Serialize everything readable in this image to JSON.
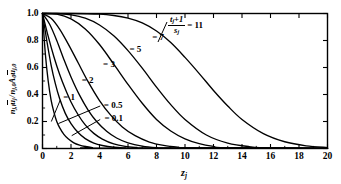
{
  "chart_data": {
    "type": "line",
    "title": "",
    "xlabel": "zj",
    "ylabel": "nj,l uj / nj,0 A0 uj,0",
    "xlim": [
      0,
      20
    ],
    "ylim": [
      0,
      1.0
    ],
    "grid": false,
    "legend_position": "inline-curve-labels",
    "xticks": [
      "0",
      "2",
      "4",
      "6",
      "8",
      "10",
      "12",
      "14",
      "16",
      "18",
      "20"
    ],
    "xtick_values": [
      0,
      2,
      4,
      6,
      8,
      10,
      12,
      14,
      16,
      18,
      20
    ],
    "yticks": [
      "0",
      "0.2",
      "0.4",
      "0.6",
      "0.8",
      "1.0"
    ],
    "ytick_values": [
      0,
      0.2,
      0.4,
      0.6,
      0.8,
      1.0
    ],
    "annotation": {
      "numerator": "tj + 1",
      "denominator": "sj",
      "equals": "= 11"
    },
    "series": [
      {
        "name": "0.1",
        "label": "= 0.1",
        "param": 0.1,
        "x": [
          0,
          0.2,
          0.4,
          0.6,
          0.8,
          1.0,
          1.2,
          1.5,
          1.8,
          2.2,
          2.6,
          3.0,
          3.5,
          4.0
        ],
        "y": [
          1.0,
          0.7,
          0.5,
          0.36,
          0.27,
          0.2,
          0.155,
          0.105,
          0.072,
          0.042,
          0.025,
          0.015,
          0.007,
          0.003
        ]
      },
      {
        "name": "0.5",
        "label": "= 0.5",
        "param": 0.5,
        "x": [
          0,
          0.3,
          0.6,
          0.9,
          1.2,
          1.6,
          2.0,
          2.5,
          3.0,
          3.6,
          4.2,
          5.0,
          5.8,
          6.6
        ],
        "y": [
          1.0,
          0.8,
          0.62,
          0.48,
          0.37,
          0.26,
          0.185,
          0.118,
          0.073,
          0.04,
          0.022,
          0.009,
          0.004,
          0.0015
        ]
      },
      {
        "name": "1",
        "label": "= 1",
        "param": 1,
        "x": [
          0,
          0.4,
          0.8,
          1.2,
          1.6,
          2.0,
          2.5,
          3.0,
          3.6,
          4.2,
          5.0,
          5.8,
          6.6,
          7.5
        ],
        "y": [
          1.0,
          0.83,
          0.68,
          0.55,
          0.44,
          0.345,
          0.25,
          0.175,
          0.112,
          0.07,
          0.034,
          0.016,
          0.008,
          0.003
        ]
      },
      {
        "name": "2",
        "label": "= 2",
        "param": 2,
        "x": [
          0,
          0.5,
          1.0,
          1.5,
          2.0,
          2.6,
          3.2,
          3.8,
          4.5,
          5.2,
          6.0,
          7.0,
          8.0,
          9.0
        ],
        "y": [
          1.0,
          0.92,
          0.8,
          0.66,
          0.53,
          0.395,
          0.285,
          0.2,
          0.128,
          0.078,
          0.042,
          0.018,
          0.007,
          0.003
        ]
      },
      {
        "name": "3",
        "label": "= 3",
        "param": 3,
        "x": [
          0,
          0.6,
          1.2,
          1.8,
          2.5,
          3.2,
          4.0,
          4.8,
          5.6,
          6.5,
          7.5,
          8.5,
          9.5,
          10.5
        ],
        "y": [
          1.0,
          0.965,
          0.885,
          0.775,
          0.635,
          0.495,
          0.355,
          0.245,
          0.16,
          0.095,
          0.048,
          0.023,
          0.01,
          0.004
        ]
      },
      {
        "name": "5",
        "label": "= 5",
        "param": 5,
        "x": [
          0,
          1.0,
          2.0,
          3.0,
          4.0,
          5.0,
          6.0,
          7.0,
          8.0,
          9.0,
          10.0,
          11.0,
          12.0,
          13.0
        ],
        "y": [
          1.0,
          0.995,
          0.96,
          0.885,
          0.77,
          0.625,
          0.475,
          0.335,
          0.215,
          0.13,
          0.072,
          0.036,
          0.016,
          0.006
        ]
      },
      {
        "name": "7",
        "label": "= 7",
        "param": 7,
        "x": [
          0,
          1.0,
          2.0,
          3.0,
          4.0,
          5.0,
          6.0,
          7.0,
          8.0,
          9.0,
          10.0,
          11.5,
          13.0,
          14.5,
          16.0
        ],
        "y": [
          1.0,
          1.0,
          0.99,
          0.965,
          0.915,
          0.835,
          0.725,
          0.595,
          0.455,
          0.325,
          0.215,
          0.1,
          0.04,
          0.014,
          0.004
        ]
      },
      {
        "name": "11",
        "label": "= 11",
        "param": 11,
        "x": [
          0,
          2.0,
          4.0,
          5.0,
          6.0,
          7.0,
          8.0,
          9.0,
          10.0,
          11.0,
          12.0,
          13.0,
          14.0,
          15.5,
          17.0,
          18.5,
          20.0
        ],
        "y": [
          1.0,
          1.0,
          0.995,
          0.985,
          0.965,
          0.93,
          0.87,
          0.785,
          0.675,
          0.555,
          0.43,
          0.315,
          0.215,
          0.11,
          0.05,
          0.02,
          0.007
        ]
      }
    ],
    "curve_label_positions": [
      {
        "name": "0.1",
        "x": 4.35,
        "y": 0.225
      },
      {
        "name": "0.5",
        "x": 4.3,
        "y": 0.325
      },
      {
        "name": "1",
        "x": 1.45,
        "y": 0.385
      },
      {
        "name": "2",
        "x": 2.75,
        "y": 0.505
      },
      {
        "name": "3",
        "x": 4.25,
        "y": 0.625
      },
      {
        "name": "5",
        "x": 6.1,
        "y": 0.735
      },
      {
        "name": "7",
        "x": 7.7,
        "y": 0.825
      }
    ]
  },
  "style": {
    "line_color": "#000000",
    "axis_color": "#000000",
    "background": "#ffffff"
  }
}
